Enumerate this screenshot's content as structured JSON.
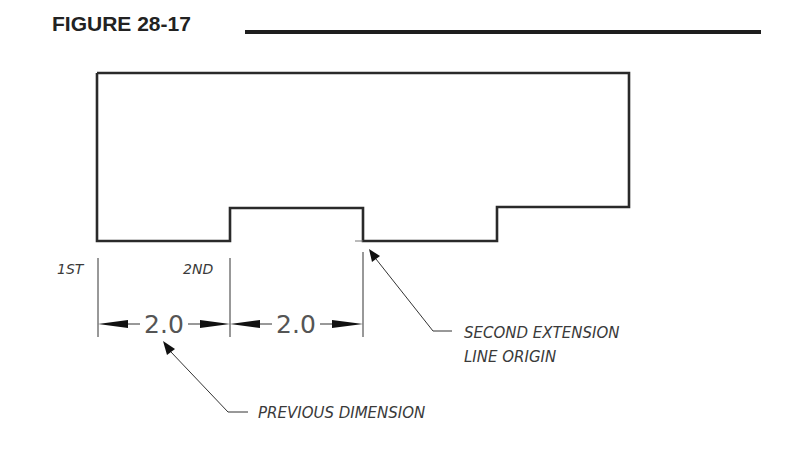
{
  "figure": {
    "title": "FIGURE 28-17"
  },
  "labels": {
    "first": "1ST",
    "second": "2ND",
    "second_extension_line_1": "SECOND EXTENSION",
    "second_extension_line_2": "LINE ORIGIN",
    "previous_dimension": "PREVIOUS DIMENSION"
  },
  "dimensions": [
    {
      "value": "2.0"
    },
    {
      "value": "2.0"
    }
  ],
  "colors": {
    "outline": "#2a2a2a",
    "text": "#3a3a3a",
    "background": "#ffffff"
  }
}
